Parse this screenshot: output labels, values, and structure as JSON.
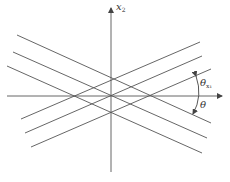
{
  "figure": {
    "axis_x2_label": "x",
    "axis_x2_sub": "2",
    "angle_upper_label": "θ",
    "angle_upper_sub": "x₁",
    "angle_lower_label": "θ"
  },
  "colors": {
    "line": "#555555",
    "background": "#ffffff"
  },
  "geometry": {
    "descending_lines": [
      [
        17,
        35,
        211,
        123
      ],
      [
        13,
        52,
        207,
        138
      ],
      [
        7,
        66,
        202,
        153
      ]
    ],
    "ascending_lines": [
      [
        21,
        119,
        200,
        42
      ],
      [
        25,
        133,
        202,
        56
      ],
      [
        31,
        147,
        211,
        69
      ]
    ]
  }
}
